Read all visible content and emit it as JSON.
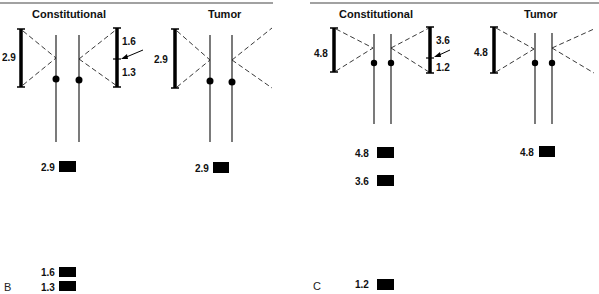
{
  "panels": [
    {
      "letter": "B",
      "constitutional": {
        "title": "Constitutional",
        "left_bracket_label": "2.9",
        "right_bracket_labels": [
          "1.6",
          "1.3"
        ],
        "bands": [
          {
            "label": "2.9",
            "value": 2.9
          },
          {
            "label": "1.6",
            "value": 1.6
          },
          {
            "label": "1.3",
            "value": 1.3
          }
        ]
      },
      "tumor": {
        "title": "Tumor",
        "left_bracket_label": "2.9",
        "bands": [
          {
            "label": "2.9",
            "value": 2.9
          }
        ]
      }
    },
    {
      "letter": "C",
      "constitutional": {
        "title": "Constitutional",
        "left_bracket_label": "4.8",
        "right_bracket_labels": [
          "3.6",
          "1.2"
        ],
        "bands": [
          {
            "label": "4.8",
            "value": 4.8
          },
          {
            "label": "3.6",
            "value": 3.6
          },
          {
            "label": "1.2",
            "value": 1.2
          }
        ]
      },
      "tumor": {
        "title": "Tumor",
        "left_bracket_label": "4.8",
        "bands": [
          {
            "label": "4.8",
            "value": 4.8
          }
        ]
      }
    }
  ]
}
